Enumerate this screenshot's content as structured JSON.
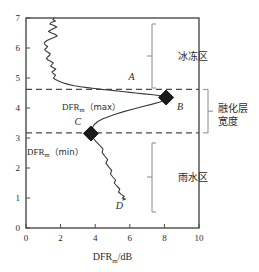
{
  "chart_data": {
    "type": "line",
    "title": "",
    "xlabel": "DFRm/dB",
    "xlabel_main": "DFR",
    "xlabel_sub": "m",
    "xlabel_unit": "/dB",
    "ylabel": "",
    "xlim": [
      0,
      10
    ],
    "ylim": [
      0,
      7
    ],
    "xticks": [
      0,
      2,
      4,
      6,
      8,
      10
    ],
    "yticks": [
      0,
      1,
      2,
      3,
      4,
      5,
      6,
      7
    ],
    "grid": false,
    "legend": "none",
    "orientation": "vertical-profile",
    "series": [
      {
        "name": "DFR profile",
        "color": "#3a3a3a",
        "x": [
          1.62,
          1.55,
          1.7,
          1.45,
          1.38,
          1.62,
          1.78,
          1.6,
          1.42,
          1.3,
          1.48,
          1.7,
          1.8,
          1.62,
          1.4,
          1.22,
          1.1,
          1.05,
          1.12,
          1.25,
          1.18,
          1.08,
          1.15,
          1.3,
          1.4,
          1.35,
          1.25,
          1.18,
          1.28,
          1.45,
          1.58,
          1.5,
          1.42,
          1.55,
          1.72,
          1.62,
          1.5,
          1.58,
          1.7,
          1.66,
          1.58,
          1.7,
          1.88,
          2.05,
          2.25,
          2.5,
          2.8,
          3.15,
          3.55,
          3.95,
          4.35,
          4.75,
          5.1,
          5.4,
          5.7,
          6.0,
          6.35,
          6.8,
          7.35,
          7.85,
          8.1,
          8.05,
          7.75,
          7.25,
          6.7,
          6.15,
          5.65,
          5.2,
          4.8,
          4.45,
          4.15,
          3.95,
          3.82,
          3.75,
          3.88,
          4.05,
          4.25,
          4.45,
          4.4,
          4.55,
          4.72,
          4.62,
          4.78,
          4.95,
          4.88,
          5.02,
          5.18,
          5.1,
          5.25,
          5.42,
          5.35,
          5.5,
          5.68,
          5.58,
          5.72,
          5.6,
          5.75
        ],
        "y": [
          7.0,
          6.95,
          6.9,
          6.85,
          6.8,
          6.75,
          6.7,
          6.65,
          6.6,
          6.55,
          6.5,
          6.45,
          6.4,
          6.35,
          6.3,
          6.25,
          6.2,
          6.15,
          6.1,
          6.05,
          6.0,
          5.95,
          5.9,
          5.85,
          5.8,
          5.75,
          5.7,
          5.65,
          5.6,
          5.55,
          5.5,
          5.45,
          5.4,
          5.35,
          5.3,
          5.25,
          5.2,
          5.15,
          5.1,
          5.05,
          5.0,
          4.95,
          4.9,
          4.86,
          4.82,
          4.78,
          4.74,
          4.71,
          4.68,
          4.65,
          4.62,
          4.6,
          4.58,
          4.56,
          4.54,
          4.52,
          4.5,
          4.47,
          4.44,
          4.4,
          4.35,
          4.28,
          4.2,
          4.12,
          4.04,
          3.96,
          3.88,
          3.8,
          3.72,
          3.64,
          3.55,
          3.45,
          3.32,
          3.15,
          3.0,
          2.88,
          2.76,
          2.64,
          2.52,
          2.4,
          2.28,
          2.16,
          2.04,
          1.92,
          1.8,
          1.7,
          1.6,
          1.5,
          1.4,
          1.3,
          1.2,
          1.12,
          1.05,
          1.0,
          0.96,
          0.93,
          0.97
        ]
      }
    ],
    "markers": [
      {
        "label": "B",
        "x": 8.1,
        "y": 4.35,
        "shape": "diamond",
        "meaning": "DFRm (max)"
      },
      {
        "label": "C",
        "x": 3.75,
        "y": 3.15,
        "shape": "diamond",
        "meaning": "DFRm (min)"
      }
    ],
    "hlines": [
      {
        "value": 4.62,
        "style": "dashed",
        "name": "melting-layer-top"
      },
      {
        "value": 3.17,
        "style": "dashed",
        "name": "melting-layer-bottom"
      }
    ],
    "point_labels": [
      {
        "text": "A",
        "x": 6.1,
        "y": 4.95
      },
      {
        "text": "B",
        "x": 8.9,
        "y": 3.95
      },
      {
        "text": "C",
        "x": 3.0,
        "y": 3.45
      },
      {
        "text": "D",
        "x": 5.4,
        "y": 0.62
      }
    ]
  },
  "annotations": {
    "dfr_max": "DFR",
    "dfr_max_sub": "m",
    "dfr_max_paren": "（max）",
    "dfr_min": "DFR",
    "dfr_min_sub": "m",
    "dfr_min_paren": "（min）",
    "zone_frozen": "冰冻区",
    "zone_melting_line1": "融化层",
    "zone_melting_line2": "宽度",
    "zone_rain": "雨水区"
  },
  "axis": {
    "x_ticks": [
      "0",
      "2",
      "4",
      "6",
      "8",
      "10"
    ],
    "y_ticks": [
      "0",
      "1",
      "2",
      "3",
      "4",
      "5",
      "6",
      "7"
    ]
  },
  "colors": {
    "axis": "#4a4a4a",
    "curve": "#3a3a3a",
    "marker": "#1a1a1a",
    "dashed": "#4a4a4a",
    "text": "#2b2b2b",
    "bracket": "#8a8a8a"
  }
}
